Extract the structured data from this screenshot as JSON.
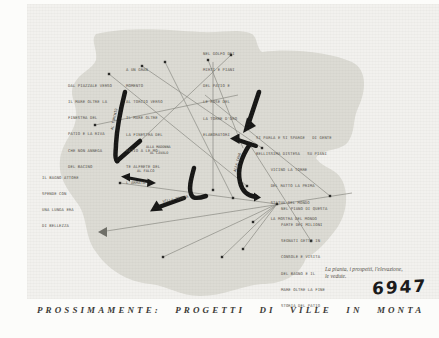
{
  "colors": {
    "paper": "#fcfcfa",
    "photo": "#f2f1ee",
    "blob": "#dcdbd4",
    "ink": "#171716",
    "line": "#8b8b84",
    "type": "#55524b"
  },
  "caption": "PROSSIMAMENTE: PROGETTI DI VILLE IN MONTA",
  "note_lines": {
    "line1": "La pianta, i prospetti, l'elevazione,",
    "line2": "le vedute."
  },
  "stamp": "6947",
  "route_labels": {
    "falco": "AL FALCO",
    "madonna1": "ALLA MADONNA",
    "madonna2": "AL CAVALO",
    "s1": "AL TORCHIO",
    "s4": "ALLA CAVA",
    "s5": "VILLA TERESA"
  },
  "text_blocks": [
    {
      "id": "a",
      "lines": [
        "DAL PIAZZALE VERSO",
        "IL MARE OLTRE LA",
        "FINESTRA DEL",
        "PATIO E LA RIVA",
        "CHE NON ANNEGA",
        "DEL BACINO"
      ]
    },
    {
      "id": "b",
      "lines": [
        "A UN GRAN",
        "MOMENTO",
        "AL TORCIO VERSO",
        "IL MARE OLTRE",
        "LA FINESTRA DEL",
        "PATIO A LE MO-",
        "TE ALFRETE DEL",
        "L'ARMATA"
      ]
    },
    {
      "id": "c",
      "lines": [
        "NEL GOLFO DEI",
        "MIRTI E PIANI",
        "DEL PATIO E",
        "LE ROSE DEL",
        "LA TORRE D'ORO",
        "ELABORATORI"
      ]
    },
    {
      "id": "d",
      "lines": [
        "SI PARLA E SI SPARGE   DI GENTE",
        "BELLISSIMA DISTESA   SU PIANI",
        "      VICINO LA TORRE",
        "      DEL RATTO LA PRIMA",
        "      STATUA DEL MONDO",
        "      LA MOSTRA DEL MONDO"
      ]
    },
    {
      "id": "e",
      "lines": [
        "IL BAGNO ATTORE",
        "SPENDE CON",
        "UNA LUNGA ERA",
        "DI BELLEZZA"
      ]
    },
    {
      "id": "f",
      "lines": [
        "NEL PIANO DI QUESTA",
        "PARTE DEI MILIONI",
        "SEGNATI GETTO IN",
        "CONSOLE E VISITA",
        "DEL BAGNO E IL",
        "MARE OLTRE LA FINE",
        "STORIA DEL PATIO"
      ]
    }
  ]
}
